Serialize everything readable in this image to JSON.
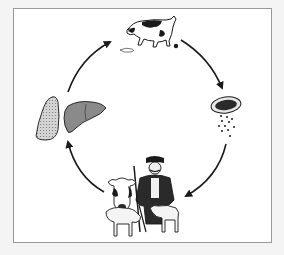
{
  "diagram": {
    "type": "life-cycle",
    "stages": [
      {
        "id": "definitive-host",
        "depiction": "dog-defecating",
        "position": "top"
      },
      {
        "id": "egg",
        "depiction": "proglottid-with-released-eggs",
        "position": "right"
      },
      {
        "id": "intermediate-hosts",
        "depiction": "man-cow-sheep",
        "position": "bottom"
      },
      {
        "id": "organ-cysts",
        "depiction": "lung-and-liver",
        "position": "left"
      }
    ],
    "arrows": [
      {
        "from": "definitive-host",
        "to": "egg"
      },
      {
        "from": "egg",
        "to": "intermediate-hosts"
      },
      {
        "from": "intermediate-hosts",
        "to": "organ-cysts"
      },
      {
        "from": "organ-cysts",
        "to": "definitive-host"
      }
    ],
    "colors": {
      "frame_border": "#9a9a9a",
      "background": "#ffffff",
      "outer_background": "#f4f4f4",
      "ink": "#1a1a1a",
      "liver_fill": "#8a8a8a",
      "lung_fill": "#c8c8c8"
    }
  }
}
